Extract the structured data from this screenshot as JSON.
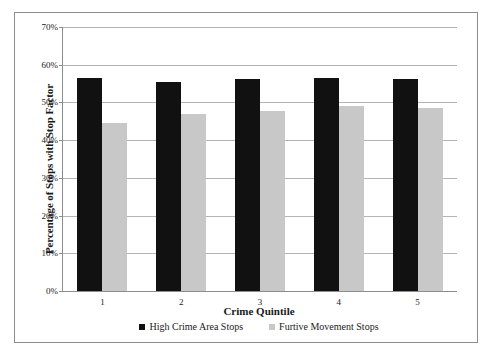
{
  "chart_data": {
    "type": "bar",
    "title": "",
    "xlabel": "Crime Quintile",
    "ylabel": "Percentage of Stops with Stop Factor",
    "categories": [
      "1",
      "2",
      "3",
      "4",
      "5"
    ],
    "series": [
      {
        "name": "High Crime Area Stops",
        "color": "#111111",
        "values": [
          56.5,
          55.3,
          56.3,
          56.6,
          56.2
        ]
      },
      {
        "name": "Furtive Movement Stops",
        "color": "#c8c8c8",
        "values": [
          44.6,
          46.9,
          47.8,
          49.0,
          48.6
        ]
      }
    ],
    "ylim": [
      0,
      70
    ],
    "ytick_values": [
      0,
      10,
      20,
      30,
      40,
      50,
      60,
      70
    ],
    "ytick_labels": [
      "0%",
      "10%",
      "20%",
      "30%",
      "40%",
      "50%",
      "60%",
      "70%"
    ],
    "grid": true,
    "legend_position": "bottom"
  }
}
